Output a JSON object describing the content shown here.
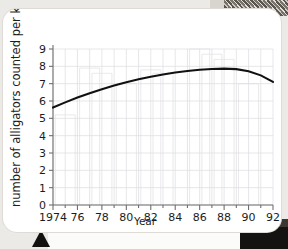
{
  "page": {
    "background_color": "#eceae7",
    "card_color": "#ffffff",
    "marker_triangle": "triangle-marker"
  },
  "chart_data": {
    "type": "line",
    "title": "",
    "xlabel": "Year",
    "ylabel": "number of alligators counted per kilometre",
    "xlim": [
      1974,
      1992
    ],
    "ylim": [
      0,
      9
    ],
    "grid": true,
    "legend": "none",
    "x_tick_labels": [
      "1974",
      "76",
      "78",
      "80",
      "82",
      "84",
      "86",
      "88",
      "90",
      "92"
    ],
    "x_tick_values": [
      1974,
      1976,
      1978,
      1980,
      1982,
      1984,
      1986,
      1988,
      1990,
      1992
    ],
    "y_tick_labels": [
      "0",
      "1",
      "2",
      "3",
      "4",
      "5",
      "6",
      "7",
      "8",
      "9"
    ],
    "y_tick_values": [
      0,
      1,
      2,
      3,
      4,
      5,
      6,
      7,
      8,
      9
    ],
    "series": [
      {
        "name": "alligators per kilometre",
        "color": "#111111",
        "x": [
          1974,
          1975,
          1976,
          1977,
          1978,
          1979,
          1980,
          1981,
          1982,
          1983,
          1984,
          1985,
          1986,
          1987,
          1988,
          1989,
          1990,
          1991,
          1992
        ],
        "values": [
          5.62,
          5.92,
          6.2,
          6.45,
          6.68,
          6.89,
          7.08,
          7.25,
          7.4,
          7.53,
          7.64,
          7.73,
          7.8,
          7.85,
          7.87,
          7.84,
          7.72,
          7.48,
          7.1
        ]
      }
    ],
    "ghost_bars": {
      "note": "faint bar outlines showing through from reverse of page",
      "x": [
        1975,
        1977,
        1978,
        1980,
        1982,
        1983,
        1986,
        1987,
        1988,
        1990
      ],
      "values": [
        5.2,
        7.9,
        7.6,
        7.0,
        7.8,
        7.6,
        9.0,
        8.7,
        8.4,
        7.0
      ]
    }
  }
}
